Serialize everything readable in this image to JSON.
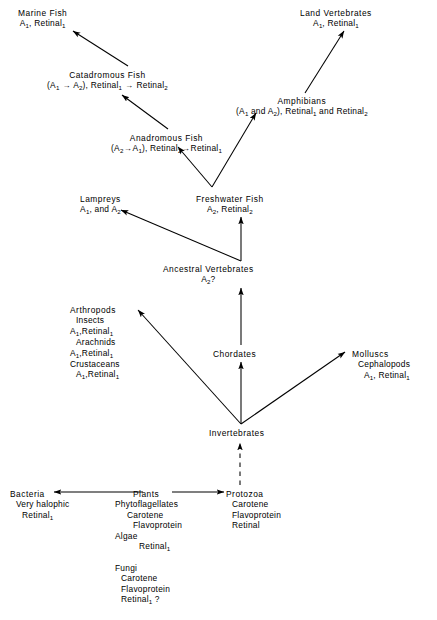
{
  "figure": {
    "type": "flow-diagram",
    "background": "#ffffff",
    "ink": "#000000"
  },
  "nodes": [
    {
      "id": "marine-fish",
      "name": "marine-fish",
      "x": 18,
      "y": 8,
      "align": "center",
      "lines": [
        {
          "text": "Marine Fish",
          "indent": 0,
          "head": true
        },
        {
          "text": "A|1|, Retinal|1|",
          "indent": 0
        }
      ]
    },
    {
      "id": "land-vertebrates",
      "name": "land-vertebrates",
      "x": 300,
      "y": 8,
      "align": "center",
      "lines": [
        {
          "text": "Land Vertebrates",
          "indent": 0,
          "head": true
        },
        {
          "text": "A|1|, Retinal|1|",
          "indent": 0
        }
      ]
    },
    {
      "id": "catadromous-fish",
      "name": "catadromous-fish",
      "x": 47,
      "y": 70,
      "align": "center",
      "lines": [
        {
          "text": "Catadromous Fish",
          "indent": 0,
          "head": true
        },
        {
          "text": "(A|1| > A|2|), Retinal|1| > Retinal|2|",
          "indent": 0
        }
      ]
    },
    {
      "id": "amphibians",
      "name": "amphibians",
      "x": 236,
      "y": 96,
      "align": "center",
      "lines": [
        {
          "text": "Amphibians",
          "indent": 0,
          "head": true
        },
        {
          "text": "(A|1| and A|2|), Retinal|1| and Retinal|2|",
          "indent": 0
        }
      ]
    },
    {
      "id": "anadromous-fish",
      "name": "anadromous-fish",
      "x": 111,
      "y": 133,
      "align": "center",
      "lines": [
        {
          "text": "Anadromous Fish",
          "indent": 0,
          "head": true
        },
        {
          "text": "(A|2|>A|1|), Retinal|2|>Retinal|1|",
          "indent": 0
        }
      ]
    },
    {
      "id": "lampreys",
      "name": "lampreys",
      "x": 80,
      "y": 194,
      "align": "center",
      "lines": [
        {
          "text": "Lampreys",
          "indent": 0,
          "head": true
        },
        {
          "text": "A|1|, and A|2|",
          "indent": 0
        }
      ]
    },
    {
      "id": "freshwater-fish",
      "name": "freshwater-fish",
      "x": 196,
      "y": 194,
      "align": "center",
      "lines": [
        {
          "text": "Freshwater Fish",
          "indent": 0,
          "head": true
        },
        {
          "text": "A|2|, Retinal|2|",
          "indent": 0
        }
      ]
    },
    {
      "id": "ancestral-vertebrates",
      "name": "ancestral-vertebrates",
      "x": 163,
      "y": 264,
      "align": "center",
      "lines": [
        {
          "text": "Ancestral  Vertebrates",
          "indent": 0,
          "head": true
        },
        {
          "text": "A|2|?",
          "indent": 0
        }
      ]
    },
    {
      "id": "arthropods",
      "name": "arthropods",
      "x": 70,
      "y": 305,
      "align": "left",
      "lines": [
        {
          "text": "Arthropods",
          "indent": 0,
          "head": true
        },
        {
          "text": "Insects",
          "indent": 1
        },
        {
          "text": "A|1|,Retinal|1|",
          "indent": 0
        },
        {
          "text": "Arachnids",
          "indent": 1
        },
        {
          "text": "A|1|,Retinal|1|",
          "indent": 0
        },
        {
          "text": "Crustaceans",
          "indent": 0
        },
        {
          "text": "A|1|,Retinal|1|",
          "indent": 1
        }
      ]
    },
    {
      "id": "chordates",
      "name": "chordates",
      "x": 213,
      "y": 349,
      "align": "center",
      "lines": [
        {
          "text": "Chordates",
          "indent": 0,
          "head": true
        }
      ]
    },
    {
      "id": "molluscs",
      "name": "molluscs",
      "x": 352,
      "y": 349,
      "align": "left",
      "lines": [
        {
          "text": "Molluscs",
          "indent": 0,
          "head": true
        },
        {
          "text": "Cephalopods",
          "indent": 1
        },
        {
          "text": "A|1|, Retinal|1|",
          "indent": 2
        }
      ]
    },
    {
      "id": "invertebrates",
      "name": "invertebrates",
      "x": 209,
      "y": 428,
      "align": "center",
      "lines": [
        {
          "text": "Invertebrates",
          "indent": 0,
          "head": true
        }
      ]
    },
    {
      "id": "bacteria",
      "name": "bacteria",
      "x": 10,
      "y": 489,
      "align": "left",
      "lines": [
        {
          "text": "Bacteria",
          "indent": 0,
          "head": true
        },
        {
          "text": "Very halophic",
          "indent": 1
        },
        {
          "text": "Retinal|1|",
          "indent": 2
        }
      ]
    },
    {
      "id": "plants",
      "name": "plants",
      "x": 115,
      "y": 489,
      "align": "left",
      "lines": [
        {
          "text": "Plants",
          "indent": 3,
          "head": true
        },
        {
          "text": "Phytoflagellates",
          "indent": 0
        },
        {
          "text": "Carotene",
          "indent": 2
        },
        {
          "text": "Flavoprotein",
          "indent": 3
        },
        {
          "text": "Algae",
          "indent": 0
        },
        {
          "text": "Retinal|1|",
          "indent": 4
        },
        {
          "text": "",
          "indent": 0
        },
        {
          "text": "Fungi",
          "indent": 0
        },
        {
          "text": "Carotene",
          "indent": 1
        },
        {
          "text": "Flavoprotein",
          "indent": 1
        },
        {
          "text": "Retinal|1| ?",
          "indent": 1
        }
      ]
    },
    {
      "id": "protozoa",
      "name": "protozoa",
      "x": 226,
      "y": 489,
      "align": "left",
      "lines": [
        {
          "text": "Protozoa",
          "indent": 0,
          "head": true
        },
        {
          "text": "Carotene",
          "indent": 1
        },
        {
          "text": "Flavoprotein",
          "indent": 1
        },
        {
          "text": "Retinal",
          "indent": 1
        }
      ]
    }
  ],
  "edges": [
    {
      "name": "edge-catadromous-to-marine",
      "from": "catadromous-fish",
      "to": "marine-fish",
      "x1": 128,
      "y1": 66,
      "x2": 73,
      "y2": 31,
      "style": "solid"
    },
    {
      "name": "edge-anadromous-to-catadromous",
      "from": "anadromous-fish",
      "to": "catadromous-fish",
      "x1": 168,
      "y1": 129,
      "x2": 122,
      "y2": 95,
      "style": "solid"
    },
    {
      "name": "edge-freshwater-to-anadromous",
      "from": "freshwater-fish",
      "to": "anadromous-fish",
      "x1": 212,
      "y1": 187,
      "x2": 178,
      "y2": 147,
      "style": "solid"
    },
    {
      "name": "edge-freshwater-to-amphibians",
      "from": "freshwater-fish",
      "to": "amphibians",
      "x1": 212,
      "y1": 187,
      "x2": 256,
      "y2": 113,
      "style": "solid"
    },
    {
      "name": "edge-amphibians-to-land",
      "from": "amphibians",
      "to": "land-vertebrates",
      "x1": 305,
      "y1": 93,
      "x2": 344,
      "y2": 31,
      "style": "solid"
    },
    {
      "name": "edge-ancestral-to-lampreys",
      "from": "ancestral-vertebrates",
      "to": "lampreys",
      "x1": 241,
      "y1": 261,
      "x2": 121,
      "y2": 210,
      "style": "solid"
    },
    {
      "name": "edge-ancestral-to-freshwater",
      "from": "ancestral-vertebrates",
      "to": "freshwater-fish",
      "x1": 241,
      "y1": 261,
      "x2": 241,
      "y2": 217,
      "style": "solid"
    },
    {
      "name": "edge-chordates-to-ancestral",
      "from": "chordates",
      "to": "ancestral-vertebrates",
      "x1": 241,
      "y1": 345,
      "x2": 241,
      "y2": 288,
      "style": "solid"
    },
    {
      "name": "edge-invertebrates-to-chordates",
      "from": "invertebrates",
      "to": "chordates",
      "x1": 241,
      "y1": 424,
      "x2": 241,
      "y2": 362,
      "style": "solid"
    },
    {
      "name": "edge-invertebrates-to-arthropods",
      "from": "invertebrates",
      "to": "arthropods",
      "x1": 241,
      "y1": 424,
      "x2": 138,
      "y2": 310,
      "style": "solid"
    },
    {
      "name": "edge-invertebrates-to-molluscs",
      "from": "invertebrates",
      "to": "molluscs",
      "x1": 241,
      "y1": 424,
      "x2": 345,
      "y2": 352,
      "style": "solid"
    },
    {
      "name": "edge-protozoa-to-invertebrates",
      "from": "protozoa",
      "to": "invertebrates",
      "x1": 240,
      "y1": 485,
      "x2": 240,
      "y2": 443,
      "style": "dashed"
    },
    {
      "name": "edge-plants-to-bacteria",
      "from": "plants",
      "to": "bacteria",
      "x1": 143,
      "y1": 492,
      "x2": 54,
      "y2": 492,
      "style": "solid"
    },
    {
      "name": "edge-plants-to-protozoa",
      "from": "plants",
      "to": "protozoa",
      "x1": 172,
      "y1": 492,
      "x2": 224,
      "y2": 492,
      "style": "solid"
    }
  ]
}
